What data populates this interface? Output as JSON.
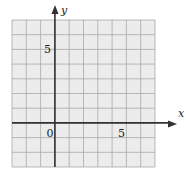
{
  "chart_data": {
    "type": "scatter",
    "title": "",
    "xlabel": "x",
    "ylabel": "y",
    "xlim": [
      -3,
      7
    ],
    "ylim": [
      -3,
      7
    ],
    "grid": true,
    "x_tick_labels": [
      {
        "value": 0,
        "label": "0"
      },
      {
        "value": 5,
        "label": "5"
      }
    ],
    "y_tick_labels": [
      {
        "value": 5,
        "label": "5"
      }
    ],
    "series": []
  },
  "colors": {
    "grid_fill": "#ececec",
    "grid_line": "#a8a8a8",
    "axis": "#333333",
    "text": "#222222"
  }
}
